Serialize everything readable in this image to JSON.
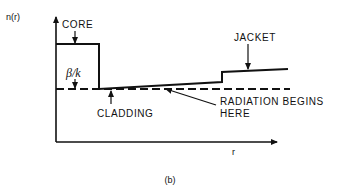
{
  "figure": {
    "caption": "(b)",
    "y_axis_label": "n(r)",
    "x_axis_label": "r",
    "threshold_label": "β/k",
    "annotations": {
      "core": "CORE",
      "cladding": "CLADDING",
      "jacket": "JACKET",
      "radiation_line1": "RADIATION BEGINS",
      "radiation_line2": "HERE"
    },
    "regions": [
      "core",
      "cladding",
      "jacket"
    ]
  }
}
